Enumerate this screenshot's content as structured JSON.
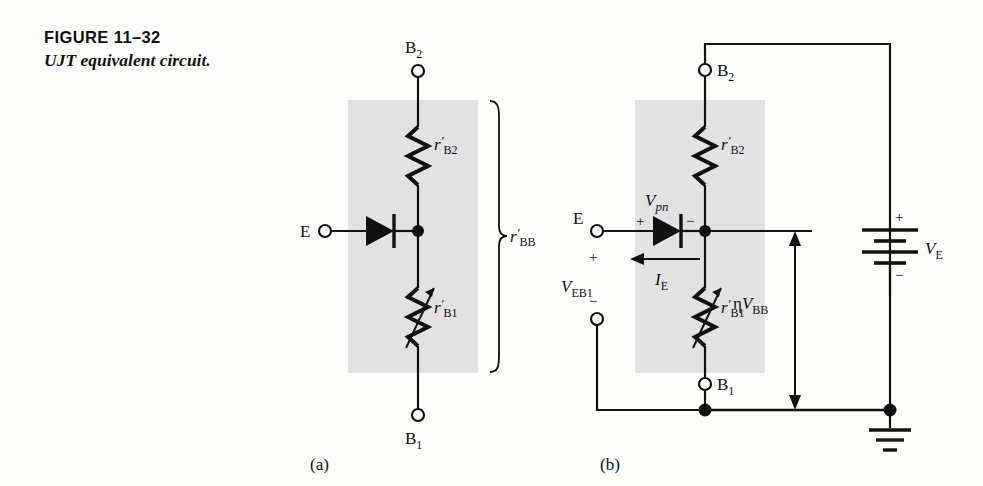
{
  "figure": {
    "number_label": "FIGURE 11–32",
    "title": "UJT equivalent circuit."
  },
  "panels": [
    {
      "id": "a",
      "caption": "(a)"
    },
    {
      "id": "b",
      "caption": "(b)"
    }
  ],
  "colors": {
    "ink": "#111111",
    "shaded_block": "#e2e2e2",
    "page_background": "#fdfdfb"
  },
  "circuit_a": {
    "terminals": [
      {
        "name": "B2",
        "base": "B",
        "sub": "2"
      },
      {
        "name": "B1",
        "base": "B",
        "sub": "1"
      },
      {
        "name": "E",
        "base": "E",
        "sub": ""
      }
    ],
    "components": [
      {
        "type": "resistor",
        "base": "r",
        "prime": "′",
        "sub": "B2"
      },
      {
        "type": "variable-resistor",
        "base": "r",
        "prime": "′",
        "sub": "B1"
      },
      {
        "type": "diode",
        "label": ""
      }
    ],
    "bracket_label": {
      "base": "r",
      "prime": "′",
      "sub": "BB"
    }
  },
  "circuit_b": {
    "terminals": [
      {
        "name": "B2",
        "base": "B",
        "sub": "2"
      },
      {
        "name": "B1",
        "base": "B",
        "sub": "1"
      },
      {
        "name": "E",
        "base": "E",
        "sub": ""
      }
    ],
    "components": [
      {
        "type": "resistor",
        "base": "r",
        "prime": "′",
        "sub": "B2"
      },
      {
        "type": "variable-resistor",
        "base": "r",
        "prime": "′",
        "sub": "B1"
      },
      {
        "type": "diode",
        "label": "Vpn"
      },
      {
        "type": "battery",
        "base": "V",
        "sub": "E"
      },
      {
        "type": "ground",
        "label": ""
      }
    ],
    "voltages": [
      {
        "base": "V",
        "italic_sub": "pn",
        "sub": "",
        "plus": "+",
        "minus": "−"
      },
      {
        "base": "V",
        "italic_sub": "",
        "sub": "EB1",
        "plus": "+",
        "minus": "−"
      },
      {
        "base": "V",
        "italic_sub": "",
        "sub": "E",
        "plus": "+",
        "minus": "−"
      }
    ],
    "currents": [
      {
        "base": "I",
        "sub": "E",
        "direction": "left"
      }
    ],
    "internal_voltage": {
      "eta": "η",
      "base": "V",
      "sub": "BB"
    }
  }
}
